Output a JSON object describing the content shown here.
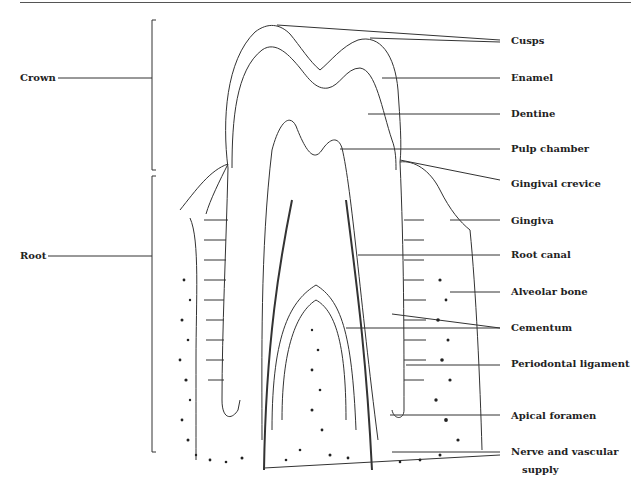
{
  "diagram": {
    "left_labels": {
      "crown": "Crown",
      "root": "Root"
    },
    "right_labels": {
      "cusps": "Cusps",
      "enamel": "Enamel",
      "dentine": "Dentine",
      "pulp_chamber": "Pulp chamber",
      "gingival_crevice": "Gingival crevice",
      "gingiva": "Gingiva",
      "root_canal": "Root canal",
      "alveolar_bone": "Alveolar bone",
      "cementum": "Cementum",
      "periodontal_ligament": "Periodontal ligament",
      "apical_foramen": "Apical foramen",
      "nerve_line1": "Nerve and vascular",
      "nerve_line2": "supply"
    },
    "colors": {
      "line": "#333333",
      "text": "#222222",
      "background": "#ffffff"
    }
  }
}
